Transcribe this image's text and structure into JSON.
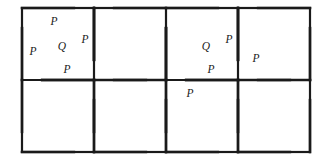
{
  "figure": {
    "background_color": "#ffffff",
    "line_color": "#1a1a1a",
    "label_color": "#1a1a1a",
    "border_stroke_width": 2.2,
    "inner_stroke_width": 2.6,
    "grid": {
      "columns": 4,
      "rows": 2,
      "cell_size": 72,
      "origin_x": 22,
      "origin_y": 8
    },
    "dissection": {
      "offset_ratio": 0.28,
      "pieces_per_cell": 5,
      "triangle_count": 4,
      "inner_square_count": 1
    }
  },
  "labels": [
    {
      "text": "P",
      "x": 54,
      "y": 22,
      "region": "upper-triangle",
      "cell": "r1c1"
    },
    {
      "text": "P",
      "x": 33,
      "y": 52,
      "region": "left-triangle",
      "cell": "r1c1"
    },
    {
      "text": "Q",
      "x": 62,
      "y": 47,
      "region": "inner-square",
      "cell": "r1c1"
    },
    {
      "text": "P",
      "x": 85,
      "y": 40,
      "region": "right-triangle",
      "cell": "r1c1"
    },
    {
      "text": "P",
      "x": 67,
      "y": 70,
      "region": "lower-triangle",
      "cell": "r1c1"
    },
    {
      "text": "Q",
      "x": 206,
      "y": 47,
      "region": "inner-square",
      "cell": "r1c3"
    },
    {
      "text": "P",
      "x": 229,
      "y": 40,
      "region": "right-triangle",
      "cell": "r1c3"
    },
    {
      "text": "P",
      "x": 211,
      "y": 70,
      "region": "lower-triangle",
      "cell": "r1c3"
    },
    {
      "text": "P",
      "x": 256,
      "y": 59,
      "region": "left-triangle",
      "cell": "r1c4"
    },
    {
      "text": "P",
      "x": 190,
      "y": 94,
      "region": "upper-triangle",
      "cell": "r2c3"
    }
  ],
  "cells": [
    {
      "id": "r1c1",
      "row": 1,
      "col": 1,
      "orientation": "pinwheel-a",
      "labeled": true
    },
    {
      "id": "r1c2",
      "row": 1,
      "col": 2,
      "orientation": "pinwheel-b",
      "labeled": false
    },
    {
      "id": "r1c3",
      "row": 1,
      "col": 3,
      "orientation": "pinwheel-a",
      "labeled": true
    },
    {
      "id": "r1c4",
      "row": 1,
      "col": 4,
      "orientation": "pinwheel-b",
      "labeled": true
    },
    {
      "id": "r2c1",
      "row": 2,
      "col": 1,
      "orientation": "pinwheel-b",
      "labeled": false
    },
    {
      "id": "r2c2",
      "row": 2,
      "col": 2,
      "orientation": "pinwheel-b",
      "labeled": false
    },
    {
      "id": "r2c3",
      "row": 2,
      "col": 3,
      "orientation": "pinwheel-b",
      "labeled": true
    },
    {
      "id": "r2c4",
      "row": 2,
      "col": 4,
      "orientation": "pinwheel-b",
      "labeled": false
    }
  ]
}
